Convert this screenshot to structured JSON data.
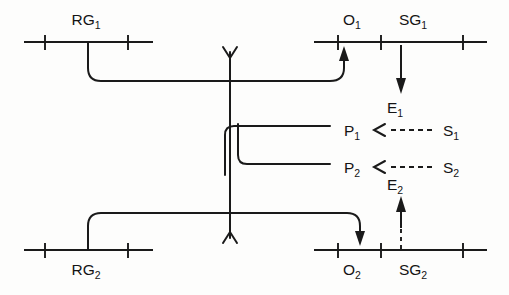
{
  "diagram": {
    "stroke_color": "#1a1a1a",
    "background_color": "#fdfdfc",
    "labels": {
      "rg1": {
        "base": "RG",
        "sub": "1"
      },
      "rg2": {
        "base": "RG",
        "sub": "2"
      },
      "o1": {
        "base": "O",
        "sub": "1"
      },
      "o2": {
        "base": "O",
        "sub": "2"
      },
      "sg1": {
        "base": "SG",
        "sub": "1"
      },
      "sg2": {
        "base": "SG",
        "sub": "2"
      },
      "p1": {
        "base": "P",
        "sub": "1"
      },
      "p2": {
        "base": "P",
        "sub": "2"
      },
      "s1": {
        "base": "S",
        "sub": "1"
      },
      "s2": {
        "base": "S",
        "sub": "2"
      },
      "e1": {
        "base": "E",
        "sub": "1"
      },
      "e2": {
        "base": "E",
        "sub": "2"
      }
    },
    "edges": [
      {
        "name": "rg1-to-operator-branch",
        "style": "solid",
        "from": "RG1",
        "to": "junction"
      },
      {
        "name": "rg2-to-operator-branch",
        "style": "solid",
        "from": "RG2",
        "to": "junction"
      },
      {
        "name": "branch-to-o1",
        "style": "solid-arrow",
        "from": "junction",
        "to": "O1"
      },
      {
        "name": "branch-to-o2",
        "style": "solid-arrow",
        "from": "junction",
        "to": "O2"
      },
      {
        "name": "junction-to-p1",
        "style": "solid",
        "from": "junction",
        "to": "P1"
      },
      {
        "name": "junction-to-p2",
        "style": "solid",
        "from": "junction",
        "to": "P2"
      },
      {
        "name": "sg1-to-e1",
        "style": "solid-arrow",
        "from": "SG1",
        "to": "E1"
      },
      {
        "name": "e2-to-sg2",
        "style": "solid-arrow",
        "from": "E2",
        "to": "SG2"
      },
      {
        "name": "s1-to-p1",
        "style": "dashed-arrow",
        "from": "S1",
        "to": "P1"
      },
      {
        "name": "s2-to-p2",
        "style": "dashed-arrow",
        "from": "S2",
        "to": "P2"
      },
      {
        "name": "e2-dashed-stem",
        "style": "dashed",
        "from": "SG2-axis",
        "to": "E2-arrow"
      }
    ]
  }
}
